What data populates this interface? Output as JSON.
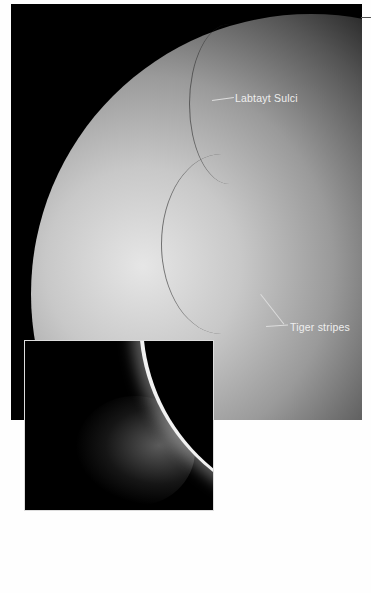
{
  "figure": {
    "main_image": {
      "subject": "Enceladus surface (grayscale)",
      "labels": [
        {
          "text": "Labtayt Sulci"
        },
        {
          "text": "Tiger stripes"
        }
      ]
    },
    "inset_image": {
      "subject": "Backlit limb with plumes"
    },
    "colors": {
      "background": "#fefefe",
      "space": "#000000",
      "label_text": "#eeeeee"
    }
  }
}
